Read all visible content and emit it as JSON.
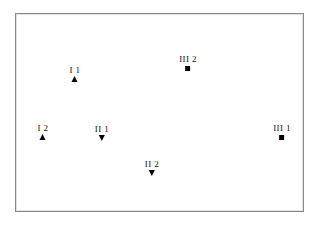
{
  "figure": {
    "background_color": "#ffffff",
    "frame": {
      "name": "plot-frame",
      "border_color": "#8a8a8a",
      "x": 15,
      "y": 13,
      "width": 289,
      "height": 199
    },
    "marker_color": "#000000",
    "label_color": "#111111"
  },
  "chart_data": {
    "type": "scatter",
    "title": "",
    "subtitle": "",
    "xlabel": "",
    "ylabel": "",
    "grid": false,
    "legend": null,
    "axis_ticks": [],
    "xlim": [
      0,
      289
    ],
    "ylim": [
      0,
      199
    ],
    "note": "Six labelled markers placed inside a plain rectangular frame; no axes, ticks or gridlines are drawn.",
    "points": [
      {
        "label": "I 1",
        "group": "I",
        "index": "1",
        "marker": "triangle-up",
        "x": 74,
        "y": 73,
        "label_x": 74,
        "label_y": 64
      },
      {
        "label": "I 2",
        "group": "I",
        "index": "2",
        "marker": "triangle-up",
        "x": 42,
        "y": 131,
        "label_x": 42,
        "label_y": 122
      },
      {
        "label": "II 1",
        "group": "II",
        "index": "1",
        "marker": "triangle-down",
        "x": 101,
        "y": 132,
        "label_x": 101,
        "label_y": 123
      },
      {
        "label": "II 2",
        "group": "II",
        "index": "2",
        "marker": "triangle-down",
        "x": 151,
        "y": 167,
        "label_x": 151,
        "label_y": 158
      },
      {
        "label": "III 1",
        "group": "III",
        "index": "1",
        "marker": "square",
        "x": 281,
        "y": 132,
        "label_x": 281,
        "label_y": 122
      },
      {
        "label": "III 2",
        "group": "III",
        "index": "2",
        "marker": "square",
        "x": 187,
        "y": 63,
        "label_x": 187,
        "label_y": 53
      }
    ]
  }
}
